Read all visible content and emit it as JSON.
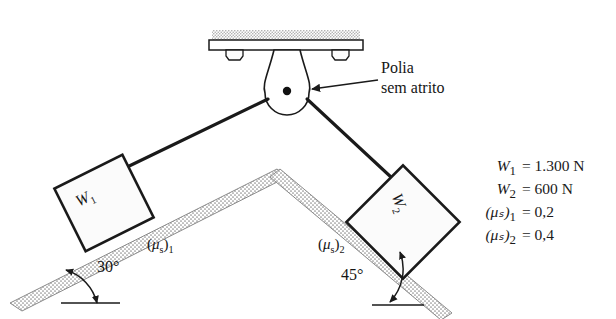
{
  "figure": {
    "callout": {
      "line1": "Polia",
      "line2": "sem atrito",
      "name": "frictionless-pulley-callout"
    },
    "blocks": [
      {
        "label": "W",
        "sub": "1",
        "name": "block-w1",
        "incline_deg": 30
      },
      {
        "label": "W",
        "sub": "2",
        "name": "block-w2",
        "incline_deg": 45
      }
    ],
    "angles": [
      {
        "text": "30°",
        "name": "angle-30"
      },
      {
        "text": "45°",
        "name": "angle-45"
      }
    ],
    "friction_labels": [
      {
        "open": "(",
        "mu": "μ",
        "musub": "s",
        "close": ")",
        "idx": "1",
        "name": "mu-s-1-label"
      },
      {
        "open": "(",
        "mu": "μ",
        "musub": "s",
        "close": ")",
        "idx": "2",
        "name": "mu-s-2-label"
      }
    ],
    "equations": [
      {
        "sym": "W",
        "sub": "1",
        "rhs": "= 1.300 N"
      },
      {
        "sym": "W",
        "sub": "2",
        "rhs": "= 600 N"
      },
      {
        "sym": "(μₛ)",
        "sub": "1",
        "rhs": "= 0,2"
      },
      {
        "sym": "(μₛ)",
        "sub": "2",
        "rhs": "= 0,4"
      }
    ],
    "colors": {
      "ink": "#1a1a1a",
      "stipple": "#9a9a9a",
      "paper": "#ffffff",
      "block_fill": "#fbfbfb"
    }
  }
}
